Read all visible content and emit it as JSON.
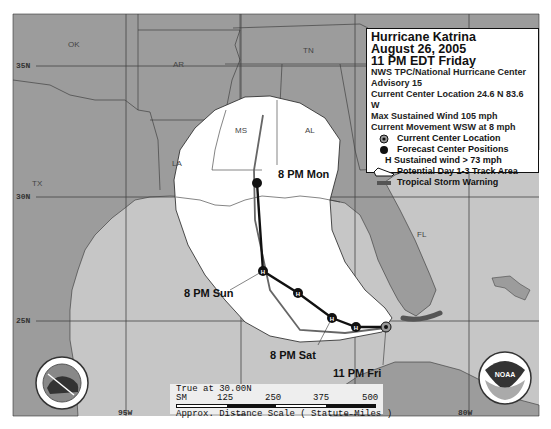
{
  "legend": {
    "title": "Hurricane Katrina",
    "date": "August 26, 2005",
    "time": "11 PM EDT Friday",
    "agency": "NWS TPC/National Hurricane Center",
    "advisory": "Advisory 15",
    "location": "Current Center Location 24.6 N  83.6 W",
    "max_wind": "Max Sustained Wind  105 mph",
    "movement": "Current Movement WSW at  8 mph",
    "items": [
      {
        "icon": "current-center-icon",
        "label": "Current Center Location"
      },
      {
        "icon": "forecast-position-icon",
        "label": "Forecast Center Positions"
      },
      {
        "icon": "hurricane-h-icon",
        "label": "H  Sustained wind > 73 mph"
      },
      {
        "icon": "track-area-icon",
        "label": "Potential Day 1-3 Track Area"
      },
      {
        "icon": "storm-warning-icon",
        "label": "Tropical Storm Warning"
      }
    ]
  },
  "states": [
    {
      "abbr": "OK",
      "x": 68,
      "y": 40
    },
    {
      "abbr": "AR",
      "x": 173,
      "y": 60
    },
    {
      "abbr": "TN",
      "x": 303,
      "y": 46
    },
    {
      "abbr": "MS",
      "x": 235,
      "y": 126
    },
    {
      "abbr": "AL",
      "x": 305,
      "y": 126
    },
    {
      "abbr": "LA",
      "x": 172,
      "y": 159
    },
    {
      "abbr": "TX",
      "x": 32,
      "y": 179
    },
    {
      "abbr": "FL",
      "x": 417,
      "y": 230
    }
  ],
  "latitudes": [
    {
      "label": "35N",
      "y": 63
    },
    {
      "label": "30N",
      "y": 196
    },
    {
      "label": "25N",
      "y": 320
    }
  ],
  "longitudes": [
    {
      "label": "95W",
      "x": 125
    },
    {
      "label": "90W",
      "x": 240
    },
    {
      "label": "85W",
      "x": 352
    },
    {
      "label": "80W",
      "x": 465
    }
  ],
  "time_labels": [
    {
      "label": "8 PM Mon",
      "x": 278,
      "y": 168
    },
    {
      "label": "8 PM Sun",
      "x": 184,
      "y": 287
    },
    {
      "label": "8 PM Sat",
      "x": 270,
      "y": 349
    },
    {
      "label": "11 PM Fri",
      "x": 333,
      "y": 367
    }
  ],
  "scale": {
    "line1": "True at 30.00N",
    "sm": "SM",
    "ticks": [
      "125",
      "250",
      "375",
      "500"
    ],
    "caption": "Approx. Distance Scale ( Statute Miles )"
  },
  "colors": {
    "land": "#9c9c9c",
    "water": "#c6c6c6",
    "cone": "#ffffff",
    "track": "#111111",
    "warning": "#555555"
  }
}
